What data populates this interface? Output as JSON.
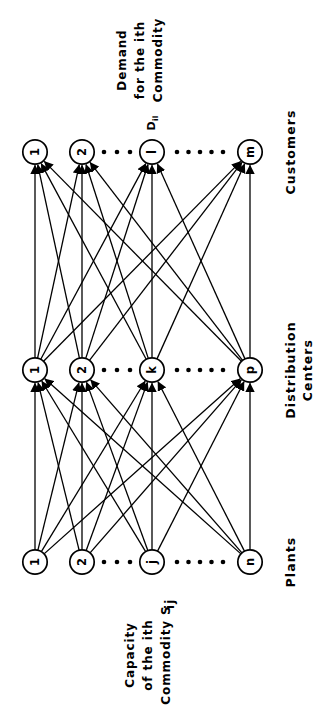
{
  "diagram": {
    "orientation_degrees": -90,
    "background_color": "#ffffff",
    "stroke_color": "#000000",
    "layers": [
      {
        "id": "plants",
        "row_label": "Plants",
        "annotation_lines": [
          "Capacity of the ith",
          "Commodity  S",
          "ij"
        ],
        "annotation_text": "Capacity of the ith Commodity  Sij",
        "nodes": [
          {
            "label": "1",
            "kind": "node"
          },
          {
            "label": "2",
            "kind": "node"
          },
          {
            "label": "···",
            "kind": "ellipsis",
            "dots": 3
          },
          {
            "label": "j",
            "kind": "node"
          },
          {
            "label": "·····",
            "kind": "ellipsis",
            "dots": 5
          },
          {
            "label": "n",
            "kind": "node"
          }
        ]
      },
      {
        "id": "distribution-centers",
        "row_label": "Distribution Centers",
        "row_label_lines": [
          "Distribution",
          "Centers"
        ],
        "annotation_lines": [],
        "annotation_text": "",
        "nodes": [
          {
            "label": "1",
            "kind": "node"
          },
          {
            "label": "2",
            "kind": "node"
          },
          {
            "label": "···",
            "kind": "ellipsis",
            "dots": 3
          },
          {
            "label": "k",
            "kind": "node"
          },
          {
            "label": "·····",
            "kind": "ellipsis",
            "dots": 5
          },
          {
            "label": "p",
            "kind": "node"
          }
        ]
      },
      {
        "id": "customers",
        "row_label": "Customers",
        "row_label_lines": [
          "Customers"
        ],
        "annotation_lines": [
          "Demand",
          "for the ith",
          "Commodity"
        ],
        "annotation_text": "Demand for the ith Commodity",
        "nodes": [
          {
            "label": "1",
            "kind": "node"
          },
          {
            "label": "2",
            "kind": "node"
          },
          {
            "label": "···",
            "kind": "ellipsis",
            "dots": 3
          },
          {
            "label": "l",
            "kind": "node",
            "edge_label": "D",
            "edge_label_sub": "il"
          },
          {
            "label": "·····",
            "kind": "ellipsis",
            "dots": 5
          },
          {
            "label": "m",
            "kind": "node"
          }
        ]
      }
    ],
    "node_labels": {
      "demand_symbol": "D",
      "demand_subscript": "il",
      "capacity_symbol": "S",
      "capacity_subscript": "ij"
    },
    "edges": {
      "plants_to_dc": [
        [
          0,
          0
        ],
        [
          0,
          1
        ],
        [
          0,
          3
        ],
        [
          0,
          5
        ],
        [
          1,
          0
        ],
        [
          1,
          1
        ],
        [
          1,
          3
        ],
        [
          1,
          5
        ],
        [
          3,
          0
        ],
        [
          3,
          1
        ],
        [
          3,
          3
        ],
        [
          3,
          5
        ],
        [
          5,
          0
        ],
        [
          5,
          1
        ],
        [
          5,
          3
        ],
        [
          5,
          5
        ]
      ],
      "dc_to_customers": [
        [
          0,
          0
        ],
        [
          0,
          1
        ],
        [
          0,
          3
        ],
        [
          0,
          5
        ],
        [
          1,
          0
        ],
        [
          1,
          1
        ],
        [
          1,
          3
        ],
        [
          1,
          5
        ],
        [
          3,
          0
        ],
        [
          3,
          1
        ],
        [
          3,
          3
        ],
        [
          3,
          5
        ],
        [
          5,
          0
        ],
        [
          5,
          1
        ],
        [
          5,
          3
        ],
        [
          5,
          5
        ]
      ],
      "arrow_direction": "plants-to-distribution-to-customers"
    }
  }
}
